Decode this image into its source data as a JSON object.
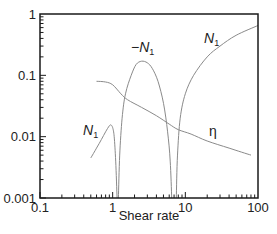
{
  "chart_data": {
    "type": "line",
    "title": "",
    "xlabel": "Shear rate",
    "ylabel": "",
    "xscale": "log",
    "yscale": "log",
    "xlim": [
      0.1,
      100
    ],
    "ylim": [
      0.001,
      1
    ],
    "grid": false,
    "x_tick_labels": [
      "0.1",
      "1",
      "10",
      "100"
    ],
    "y_tick_labels": [
      "0.001",
      "0.01",
      "0.1",
      "1"
    ],
    "series": [
      {
        "name": "N1 (low shear)",
        "label": "N1",
        "points": [
          [
            0.5,
            0.0045
          ],
          [
            0.6,
            0.0065
          ],
          [
            0.7,
            0.009
          ],
          [
            0.8,
            0.012
          ],
          [
            0.9,
            0.015
          ],
          [
            0.95,
            0.0155
          ],
          [
            1.0,
            0.014
          ],
          [
            1.05,
            0.01
          ],
          [
            1.1,
            0.004
          ],
          [
            1.15,
            0.001
          ]
        ]
      },
      {
        "name": "-N1",
        "label": "-N1",
        "points": [
          [
            1.2,
            0.001
          ],
          [
            1.25,
            0.005
          ],
          [
            1.35,
            0.02
          ],
          [
            1.5,
            0.05
          ],
          [
            1.8,
            0.1
          ],
          [
            2.1,
            0.15
          ],
          [
            2.5,
            0.17
          ],
          [
            3.0,
            0.16
          ],
          [
            3.5,
            0.13
          ],
          [
            4.2,
            0.08
          ],
          [
            5.0,
            0.035
          ],
          [
            5.7,
            0.012
          ],
          [
            6.2,
            0.004
          ],
          [
            6.5,
            0.001
          ]
        ]
      },
      {
        "name": "N1 (high shear)",
        "label": "N1",
        "points": [
          [
            7.5,
            0.001
          ],
          [
            7.8,
            0.005
          ],
          [
            8.5,
            0.02
          ],
          [
            10,
            0.05
          ],
          [
            13,
            0.1
          ],
          [
            20,
            0.2
          ],
          [
            30,
            0.3
          ],
          [
            50,
            0.45
          ],
          [
            100,
            0.65
          ]
        ]
      },
      {
        "name": "eta",
        "label": "η",
        "points": [
          [
            0.6,
            0.08
          ],
          [
            0.8,
            0.078
          ],
          [
            1.0,
            0.07
          ],
          [
            1.3,
            0.05
          ],
          [
            1.6,
            0.04
          ],
          [
            2.5,
            0.03
          ],
          [
            4,
            0.022
          ],
          [
            6,
            0.016
          ],
          [
            8,
            0.013
          ],
          [
            12,
            0.011
          ],
          [
            20,
            0.0085
          ],
          [
            40,
            0.0065
          ],
          [
            80,
            0.005
          ]
        ]
      }
    ],
    "annotations": [
      {
        "text": "N1",
        "x": 0.62,
        "y": 0.015
      },
      {
        "text": "-N1",
        "x": 3.2,
        "y": 0.5
      },
      {
        "text": "N1",
        "x": 24,
        "y": 0.6
      },
      {
        "text": "η",
        "x": 30,
        "y": 0.014
      }
    ]
  },
  "labels": {
    "xlabel": "Shear rate",
    "x_ticks": [
      "0.1",
      "1",
      "10",
      "100"
    ],
    "y_ticks": [
      "0.001",
      "0.01",
      "0.1",
      "1"
    ],
    "anno_n1_low": "N",
    "anno_neg_n1_prefix": "−N",
    "anno_n1_high": "N",
    "anno_sub": "1",
    "anno_eta": "η"
  },
  "colors": {
    "axis": "#1a1a1a",
    "curve": "#8a8a8a"
  }
}
